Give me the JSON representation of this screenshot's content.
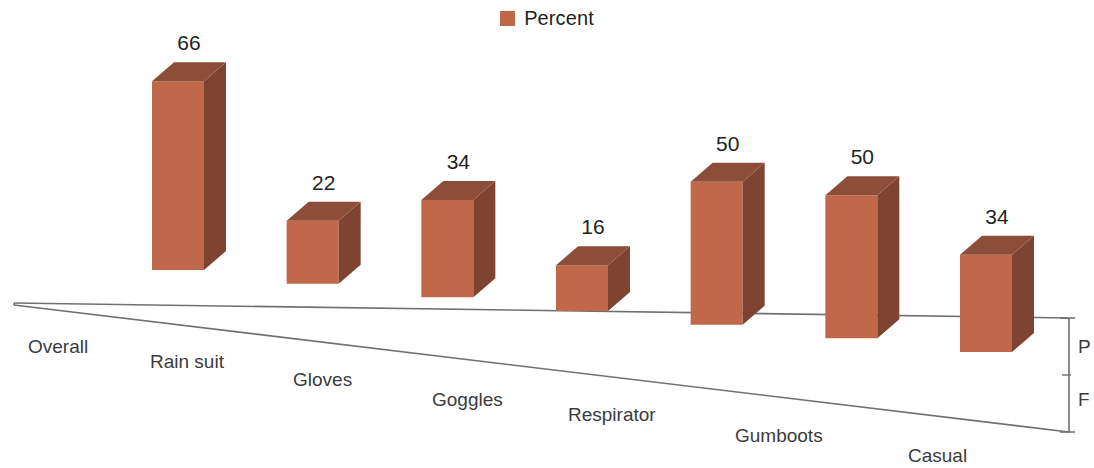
{
  "legend": {
    "label": "Percent",
    "swatch_color": "#c1674a",
    "position": "top-center"
  },
  "colors": {
    "bar_front": "#c1674a",
    "bar_side": "#7e4331",
    "bar_top": "#8d4e39",
    "axis_line": "#6f7072",
    "label_text": "#231f20",
    "category_text": "#3b3b3d",
    "background": "#ffffff"
  },
  "edge_labels": [
    {
      "text": "P",
      "x": 1078,
      "y": 337
    },
    {
      "text": "F",
      "x": 1078,
      "y": 390
    }
  ],
  "chart_data": {
    "type": "bar",
    "title": "",
    "subtitle": "",
    "xlabel": "",
    "ylabel": "",
    "grid": false,
    "three_d": true,
    "legend_position": "top-center",
    "categories": [
      "Overall",
      "Rain suit",
      "Gloves",
      "Goggles",
      "Respirator",
      "Gumboots",
      "Casual"
    ],
    "series": [
      {
        "name": "Percent",
        "values": [
          66,
          22,
          34,
          16,
          50,
          50,
          34
        ]
      }
    ],
    "data_labels": [
      "66",
      "22",
      "34",
      "16",
      "50",
      "50",
      "34"
    ],
    "ylim": [
      0,
      70
    ],
    "tick_labels": []
  }
}
